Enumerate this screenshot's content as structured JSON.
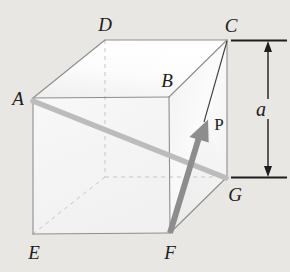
{
  "figure": {
    "background_color": "#e9e7e3",
    "labels": {
      "a": "A",
      "b": "B",
      "c": "C",
      "d": "D",
      "e": "E",
      "f": "F",
      "g": "G",
      "p": "P",
      "side": "a"
    },
    "colors": {
      "edge": "#8f8f8f",
      "hidden_edge": "#c2c2c2",
      "face_top": "#fbfbfb",
      "face_front": "#f6f6f6",
      "face_right": "#f2f2f2",
      "diagonal_line": "#b9b9b9",
      "vector_arrow": "#8d8d8d",
      "thin_line": "#3a3a3a",
      "dimension_line": "#1e1e1e",
      "label_text": "#1c1c1c"
    },
    "vertices": {
      "A": [
        33,
        98
      ],
      "B": [
        169,
        97
      ],
      "C": [
        227,
        40
      ],
      "D": [
        105,
        40
      ],
      "E": [
        33,
        234
      ],
      "F": [
        170,
        233
      ],
      "G": [
        227,
        177
      ],
      "H": [
        105,
        177
      ]
    },
    "label_positions": {
      "A": [
        18,
        98
      ],
      "B": [
        167,
        80
      ],
      "C": [
        230,
        25
      ],
      "D": [
        105,
        24
      ],
      "E": [
        34,
        252
      ],
      "F": [
        170,
        252
      ],
      "G": [
        234,
        194
      ],
      "P": [
        219,
        124
      ],
      "side": [
        261,
        109
      ]
    },
    "annotations": {
      "diagonal": {
        "from": "A",
        "to": "G",
        "style": "thick-light-gray"
      },
      "vector": {
        "from": "F",
        "to": "P",
        "tip": [
          205,
          121
        ],
        "style": "gray-arrow"
      },
      "thin_edge": {
        "from": "C",
        "to": "P",
        "style": "thin-dark-line"
      },
      "dimension": {
        "label": "a",
        "x": 268,
        "top_y": 41,
        "bottom_y": 177,
        "tick_left": 231,
        "tick_right": 287,
        "double_headed": true
      }
    }
  }
}
